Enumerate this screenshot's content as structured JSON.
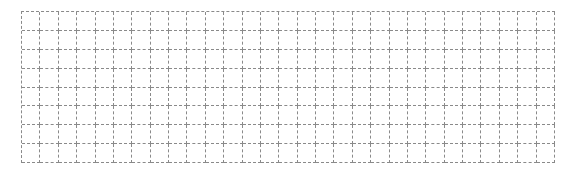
{
  "grid": {
    "rows": 8,
    "columns": 29,
    "line_color": "#8a8a8a",
    "line_style": "dashed",
    "background": "#ffffff"
  }
}
